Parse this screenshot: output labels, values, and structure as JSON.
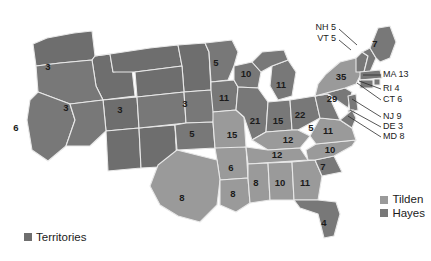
{
  "figure": {
    "background_color": "#ffffff"
  },
  "colors": {
    "tilden": "#9a9a9a",
    "hayes": "#787878",
    "territories": "#6e6e6e",
    "border": "#e8e8e8",
    "text": "#1b1b1b",
    "callout_line": "#2b2b2b"
  },
  "legend": {
    "position": "bottom-right",
    "items": [
      {
        "label": "Tilden",
        "color": "#9a9a9a",
        "swatch": "square-swatch"
      },
      {
        "label": "Hayes",
        "color": "#787878",
        "swatch": "square-swatch"
      }
    ]
  },
  "territories_legend": {
    "label": "Territories",
    "color": "#6e6e6e",
    "swatch": "square-swatch",
    "position": "bottom-left"
  },
  "chart_data": {
    "type": "map",
    "subtitle": "",
    "xlabel": "",
    "ylabel": "",
    "legend_position": "bottom-right",
    "grid": false,
    "series": [
      {
        "name": "Tilden",
        "color": "#9a9a9a"
      },
      {
        "name": "Hayes",
        "color": "#787878"
      },
      {
        "name": "Territories",
        "color": "#6e6e6e"
      }
    ],
    "categories": [
      "Oregon",
      "California",
      "Nevada",
      "Colorado",
      "Nebraska",
      "Kansas",
      "Minnesota",
      "Iowa",
      "Missouri",
      "Arkansas",
      "Texas",
      "Louisiana",
      "Wisconsin",
      "Michigan",
      "Illinois",
      "Indiana",
      "Ohio",
      "Kentucky",
      "Tennessee",
      "Mississippi",
      "Alabama",
      "Georgia",
      "Florida",
      "South Carolina",
      "North Carolina",
      "Virginia",
      "West Virginia",
      "Pennsylvania",
      "New York",
      "Maine",
      "New Hampshire",
      "Vermont",
      "Massachusetts",
      "Rhode Island",
      "Connecticut",
      "New Jersey",
      "Delaware",
      "Maryland"
    ],
    "values": [
      3,
      6,
      3,
      3,
      3,
      5,
      5,
      11,
      15,
      6,
      8,
      8,
      10,
      11,
      21,
      15,
      22,
      12,
      12,
      8,
      10,
      11,
      4,
      7,
      10,
      11,
      5,
      29,
      35,
      7,
      5,
      5,
      13,
      4,
      6,
      9,
      3,
      8
    ],
    "winner": [
      "Hayes",
      "Hayes",
      "Hayes",
      "Hayes",
      "Hayes",
      "Hayes",
      "Hayes",
      "Hayes",
      "Tilden",
      "Tilden",
      "Tilden",
      "Tilden",
      "Hayes",
      "Hayes",
      "Hayes",
      "Hayes",
      "Hayes",
      "Tilden",
      "Tilden",
      "Tilden",
      "Tilden",
      "Tilden",
      "Hayes",
      "Hayes",
      "Tilden",
      "Tilden",
      "Hayes",
      "Hayes",
      "Tilden",
      "Hayes",
      "Hayes",
      "Hayes",
      "Hayes",
      "Hayes",
      "Tilden",
      "Tilden",
      "Tilden",
      "Tilden"
    ]
  },
  "states": [
    {
      "code": "OR",
      "name": "Oregon",
      "ev": "3",
      "winner": "Hayes",
      "lx": 48,
      "ly": 67
    },
    {
      "code": "CA",
      "name": "California",
      "ev": "6",
      "winner": "Hayes",
      "lx": 16,
      "ly": 128
    },
    {
      "code": "NV",
      "name": "Nevada",
      "ev": "3",
      "winner": "Hayes",
      "lx": 66,
      "ly": 108
    },
    {
      "code": "CO",
      "name": "Colorado",
      "ev": "3",
      "winner": "Hayes",
      "lx": 120,
      "ly": 110
    },
    {
      "code": "NE",
      "name": "Nebraska",
      "ev": "3",
      "winner": "Hayes",
      "lx": 185,
      "ly": 104
    },
    {
      "code": "KS",
      "name": "Kansas",
      "ev": "5",
      "winner": "Hayes",
      "lx": 192,
      "ly": 134
    },
    {
      "code": "MN",
      "name": "Minnesota",
      "ev": "5",
      "winner": "Hayes",
      "lx": 216,
      "ly": 63
    },
    {
      "code": "IA",
      "name": "Iowa",
      "ev": "11",
      "winner": "Hayes",
      "lx": 224,
      "ly": 98
    },
    {
      "code": "MO",
      "name": "Missouri",
      "ev": "15",
      "winner": "Tilden",
      "lx": 232,
      "ly": 135
    },
    {
      "code": "AR",
      "name": "Arkansas",
      "ev": "6",
      "winner": "Tilden",
      "lx": 231,
      "ly": 168
    },
    {
      "code": "TX",
      "name": "Texas",
      "ev": "8",
      "winner": "Tilden",
      "lx": 182,
      "ly": 198
    },
    {
      "code": "LA",
      "name": "Louisiana",
      "ev": "8",
      "winner": "Tilden",
      "lx": 233,
      "ly": 194
    },
    {
      "code": "WI",
      "name": "Wisconsin",
      "ev": "10",
      "winner": "Hayes",
      "lx": 246,
      "ly": 74
    },
    {
      "code": "MI",
      "name": "Michigan",
      "ev": "11",
      "winner": "Hayes",
      "lx": 281,
      "ly": 85
    },
    {
      "code": "IL",
      "name": "Illinois",
      "ev": "21",
      "winner": "Hayes",
      "lx": 255,
      "ly": 121
    },
    {
      "code": "IN",
      "name": "Indiana",
      "ev": "15",
      "winner": "Hayes",
      "lx": 278,
      "ly": 121
    },
    {
      "code": "OH",
      "name": "Ohio",
      "ev": "22",
      "winner": "Hayes",
      "lx": 300,
      "ly": 115
    },
    {
      "code": "KY",
      "name": "Kentucky",
      "ev": "12",
      "winner": "Tilden",
      "lx": 288,
      "ly": 140
    },
    {
      "code": "TN",
      "name": "Tennessee",
      "ev": "12",
      "winner": "Tilden",
      "lx": 277,
      "ly": 155
    },
    {
      "code": "MS",
      "name": "Mississippi",
      "ev": "8",
      "winner": "Tilden",
      "lx": 256,
      "ly": 183
    },
    {
      "code": "AL",
      "name": "Alabama",
      "ev": "10",
      "winner": "Tilden",
      "lx": 280,
      "ly": 183
    },
    {
      "code": "GA",
      "name": "Georgia",
      "ev": "11",
      "winner": "Tilden",
      "lx": 305,
      "ly": 183
    },
    {
      "code": "FL",
      "name": "Florida",
      "ev": "4",
      "winner": "Hayes",
      "lx": 324,
      "ly": 223
    },
    {
      "code": "SC",
      "name": "South Carolina",
      "ev": "7",
      "winner": "Hayes",
      "lx": 323,
      "ly": 167
    },
    {
      "code": "NC",
      "name": "North Carolina",
      "ev": "10",
      "winner": "Tilden",
      "lx": 330,
      "ly": 150
    },
    {
      "code": "VA",
      "name": "Virginia",
      "ev": "11",
      "winner": "Tilden",
      "lx": 328,
      "ly": 131
    },
    {
      "code": "WV",
      "name": "West Virginia",
      "ev": "5",
      "winner": "Hayes",
      "lx": 311,
      "ly": 128
    },
    {
      "code": "PA",
      "name": "Pennsylvania",
      "ev": "29",
      "winner": "Hayes",
      "lx": 332,
      "ly": 99
    },
    {
      "code": "NY",
      "name": "New York",
      "ev": "35",
      "winner": "Tilden",
      "lx": 341,
      "ly": 77
    },
    {
      "code": "ME",
      "name": "Maine",
      "ev": "7",
      "winner": "Hayes",
      "lx": 375,
      "ly": 44
    }
  ],
  "callouts": [
    {
      "label": "NH 5",
      "name": "new-hampshire",
      "tx": 336,
      "ty": 28,
      "align": "end",
      "lx1": 339,
      "ly1": 29,
      "lx2": 357,
      "ly2": 45
    },
    {
      "label": "VT 5",
      "name": "vermont",
      "tx": 336,
      "ty": 39,
      "align": "end",
      "lx1": 339,
      "ly1": 40,
      "lx2": 351,
      "ly2": 50
    },
    {
      "label": "MA 13",
      "name": "massachusetts",
      "tx": 383,
      "ty": 75,
      "align": "start",
      "lx1": 381,
      "ly1": 75,
      "lx2": 363,
      "ly2": 75
    },
    {
      "label": "RI 4",
      "name": "rhode-island",
      "tx": 383,
      "ty": 89,
      "align": "start",
      "lx1": 381,
      "ly1": 89,
      "lx2": 359,
      "ly2": 81
    },
    {
      "label": "CT 6",
      "name": "connecticut",
      "tx": 383,
      "ty": 100,
      "align": "start",
      "lx1": 381,
      "ly1": 100,
      "lx2": 357,
      "ly2": 83
    },
    {
      "label": "NJ 9",
      "name": "new-jersey",
      "tx": 383,
      "ty": 117,
      "align": "start",
      "lx1": 381,
      "ly1": 117,
      "lx2": 352,
      "ly2": 99
    },
    {
      "label": "DE 3",
      "name": "delaware",
      "tx": 383,
      "ty": 127,
      "align": "start",
      "lx1": 381,
      "ly1": 127,
      "lx2": 350,
      "ly2": 110
    },
    {
      "label": "MD 8",
      "name": "maryland",
      "tx": 383,
      "ty": 137,
      "align": "start",
      "lx1": 381,
      "ly1": 137,
      "lx2": 348,
      "ly2": 116
    }
  ],
  "map_regions": {
    "territories_note": "Unnumbered western interior region shown as Territories"
  }
}
